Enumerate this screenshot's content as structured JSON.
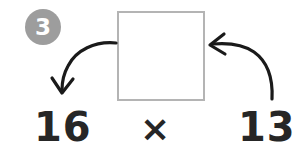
{
  "worksheet": {
    "step_badge": {
      "number": "3",
      "circle_color": "#9d9d9d",
      "text_color": "#ffffff",
      "name": "step-number-badge"
    },
    "answer_box": {
      "value": "",
      "border_color": "#b4b4b4",
      "fill_color": "#ffffff"
    },
    "equation": {
      "left_operand": "16",
      "operator": "×",
      "right_operand": "13",
      "text_color": "#262626"
    },
    "arrows": {
      "left": {
        "name": "curved-arrow-left-down",
        "color": "#1a1a1a",
        "description": "curved arrow from box left edge sweeping down-left to the 16",
        "points_to": "16"
      },
      "right": {
        "name": "curved-arrow-right-up",
        "color": "#1a1a1a",
        "description": "curved arrow from the 13 sweeping up-left to the box right edge",
        "points_to": "answer-box"
      }
    }
  }
}
